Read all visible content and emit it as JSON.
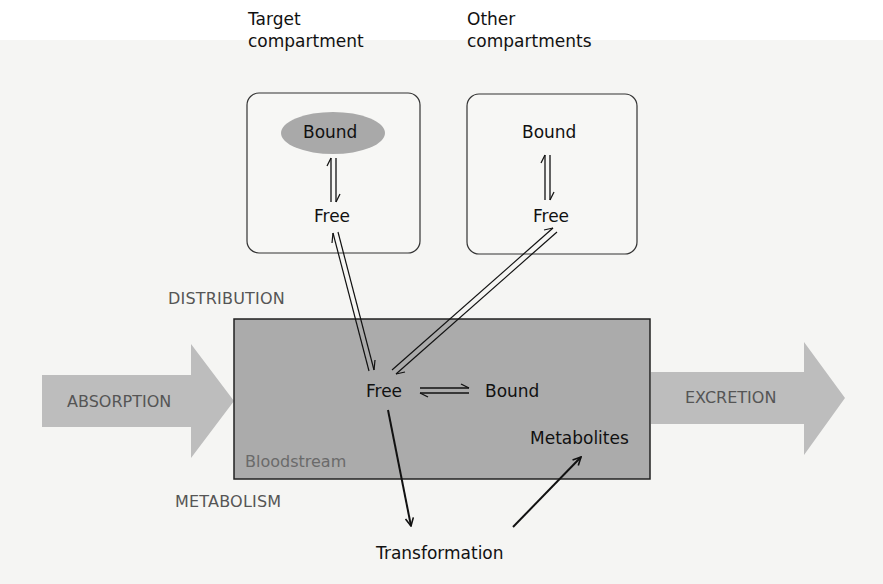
{
  "colors": {
    "background": "#f5f5f3",
    "bloodstream_fill": "#ababab",
    "process_arrow_fill": "#bdbdbd",
    "bound_ellipse_fill": "#a9a9a9",
    "line": "#111111",
    "process_text": "#555555"
  },
  "compartments": {
    "target": {
      "heading_line1": "Target",
      "heading_line2": "compartment",
      "bound": "Bound",
      "free": "Free"
    },
    "other": {
      "heading_line1": "Other",
      "heading_line2": "compartments",
      "bound": "Bound",
      "free": "Free"
    }
  },
  "bloodstream": {
    "label": "Bloodstream",
    "free": "Free",
    "bound": "Bound",
    "metabolites": "Metabolites"
  },
  "processes": {
    "absorption": "ABSORPTION",
    "distribution": "DISTRIBUTION",
    "metabolism": "METABOLISM",
    "excretion": "EXCRETION"
  },
  "transformation": "Transformation",
  "edges": [
    {
      "from": "target.bound",
      "to": "target.free",
      "type": "equilibrium"
    },
    {
      "from": "other.bound",
      "to": "other.free",
      "type": "equilibrium"
    },
    {
      "from": "target.free",
      "to": "bloodstream.free",
      "type": "reversible"
    },
    {
      "from": "bloodstream.free",
      "to": "other.free",
      "type": "reversible"
    },
    {
      "from": "bloodstream.free",
      "to": "bloodstream.bound",
      "type": "equilibrium"
    },
    {
      "from": "bloodstream.free",
      "to": "transformation",
      "type": "directed"
    },
    {
      "from": "transformation",
      "to": "bloodstream.metabolites",
      "type": "directed"
    }
  ]
}
